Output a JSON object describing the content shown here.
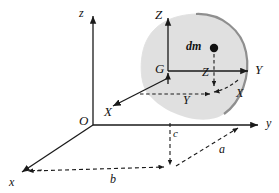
{
  "figure": {
    "background_color": "#ffffff",
    "line_color": "#1a1a1a",
    "body_fill": "#dedede",
    "body_edge": "#9a9a9a",
    "mass_dot_color": "#111111",
    "labels": {
      "fixed_z": "z",
      "fixed_y": "y",
      "fixed_x": "x",
      "origin": "O",
      "body_Z": "Z",
      "body_Y": "Y",
      "body_X": "X",
      "centroid": "G",
      "mass_element": "dm",
      "coord_Z": "Z",
      "coord_Y": "Y",
      "coord_X": "X",
      "dim_a": "a",
      "dim_b": "b",
      "dim_c": "c"
    }
  },
  "geometry": {
    "origin": {
      "x": 93,
      "y": 125
    },
    "centroid": {
      "x": 168,
      "y": 71
    },
    "mass_point": {
      "x": 214,
      "y": 48
    },
    "foot_point": {
      "x": 170,
      "y": 168
    },
    "fixed_axes": {
      "z_tip": {
        "x": 93,
        "y": 14
      },
      "y_tip": {
        "x": 262,
        "y": 125
      },
      "x_tip": {
        "x": 19,
        "y": 175
      }
    },
    "body_axes": {
      "Z_tip": {
        "x": 168,
        "y": 16
      },
      "Y_tip": {
        "x": 252,
        "y": 71
      },
      "X_tip": {
        "x": 112,
        "y": 107
      }
    }
  }
}
